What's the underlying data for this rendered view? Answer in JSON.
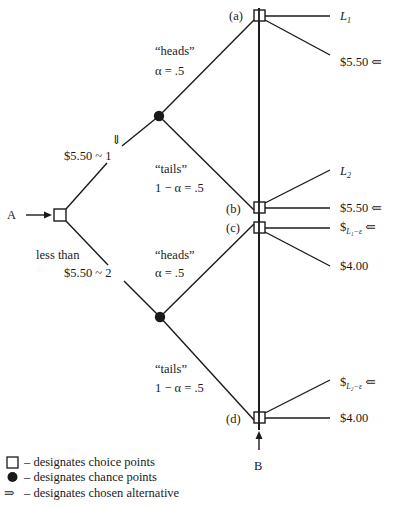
{
  "diagram": {
    "type": "decision_tree",
    "colors": {
      "ink": "#1a1a1a",
      "background": "#ffffff"
    },
    "start_node": {
      "label": "A",
      "arrow": "→",
      "kind": "choice"
    },
    "upper_branch": {
      "choice_label": "$5.50 ~ 1",
      "chosen_marker": "⇓",
      "heads": {
        "label": "“heads”",
        "prob": "α = .5"
      },
      "tails": {
        "label": "“tails”",
        "prob": "1 − α = .5"
      }
    },
    "lower_branch": {
      "choice_label_line1": "less than",
      "choice_label_line2": "$5.50 ~ 2",
      "heads": {
        "label": "“heads”",
        "prob": "α = .5"
      },
      "tails": {
        "label": "“tails”",
        "prob": "1 − α = .5"
      }
    },
    "choice_points": [
      {
        "id": "a",
        "label": "(a)",
        "outcomes": [
          {
            "text": "L",
            "sub": "1",
            "italic": true,
            "chosen": false
          },
          {
            "text": "$5.50",
            "chosen": true
          }
        ]
      },
      {
        "id": "b",
        "label": "(b)",
        "outcomes": [
          {
            "text": "L",
            "sub": "2",
            "italic": true,
            "chosen": false
          },
          {
            "text": "$5.50",
            "chosen": true
          }
        ]
      },
      {
        "id": "c",
        "label": "(c)",
        "outcomes": [
          {
            "text": "$",
            "sub": "L1−ε",
            "chosen": true
          },
          {
            "text": "$4.00",
            "chosen": false
          }
        ]
      },
      {
        "id": "d",
        "label": "(d)",
        "outcomes": [
          {
            "text": "$",
            "sub": "L2−ε",
            "chosen": true
          },
          {
            "text": "$4.00",
            "chosen": false
          }
        ]
      }
    ],
    "chosen_arrow": "⇐",
    "cut_label": {
      "label": "B",
      "arrow": "↑"
    }
  },
  "labels": {
    "a_node": "A",
    "b_cut": "B",
    "pt_a": "(a)",
    "pt_b": "(b)",
    "pt_c": "(c)",
    "pt_d": "(d)",
    "L": "L",
    "one": "1",
    "two": "2",
    "dollar": "$",
    "sub_L1e": "L₁−ε",
    "sub_L2e": "L₂−ε",
    "price_550": "$5.50",
    "price_400": "$4.00",
    "chosen_arrow": "⇐",
    "down_arrow": "⇓",
    "heads": "“heads”",
    "tails": "“tails”",
    "alpha": "α = .5",
    "one_minus_alpha": "1 − α = .5",
    "up_choice": "$5.50 ~ 1",
    "less_than": "less than",
    "low_choice": "$5.50 ~ 2"
  },
  "legend": {
    "items": [
      {
        "symbol": "□",
        "text": "– designates choice points"
      },
      {
        "symbol": "●",
        "text": "– designates chance points"
      },
      {
        "symbol": "⇒",
        "text": "– designates chosen alternative"
      }
    ]
  }
}
